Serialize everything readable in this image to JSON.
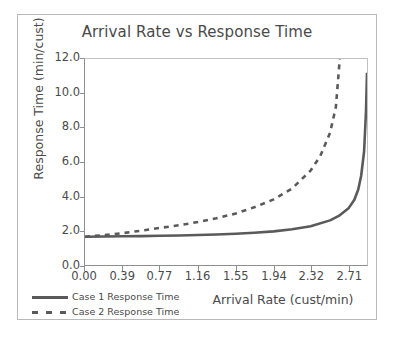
{
  "chart_data": {
    "type": "line",
    "title": "Arrival Rate vs Response Time",
    "xlabel": "Arrival Rate (cust/min)",
    "ylabel": "Response Time (min/cust)",
    "xlim": [
      0.0,
      2.9
    ],
    "ylim": [
      0.0,
      12.0
    ],
    "xticks": [
      "0.00",
      "0.39",
      "0.77",
      "1.16",
      "1.55",
      "1.94",
      "2.32",
      "2.71"
    ],
    "xtick_values": [
      0.0,
      0.39,
      0.77,
      1.16,
      1.55,
      1.94,
      2.32,
      2.71
    ],
    "yticks": [
      "0.0",
      "2.0",
      "4.0",
      "6.0",
      "8.0",
      "10.0",
      "12.0"
    ],
    "ytick_values": [
      0.0,
      2.0,
      4.0,
      6.0,
      8.0,
      10.0,
      12.0
    ],
    "grid": false,
    "legend_position": "bottom-left",
    "series": [
      {
        "name": "Case 1 Response Time",
        "style": "solid",
        "color": "#5a5a5a",
        "x": [
          0.0,
          0.2,
          0.39,
          0.58,
          0.77,
          0.97,
          1.16,
          1.35,
          1.55,
          1.74,
          1.94,
          2.13,
          2.32,
          2.52,
          2.61,
          2.71,
          2.77,
          2.81,
          2.84,
          2.87,
          2.89,
          2.9
        ],
        "y": [
          1.65,
          1.66,
          1.67,
          1.68,
          1.7,
          1.72,
          1.75,
          1.78,
          1.82,
          1.88,
          1.96,
          2.08,
          2.26,
          2.6,
          2.86,
          3.3,
          3.8,
          4.4,
          5.2,
          6.6,
          9.0,
          11.2
        ]
      },
      {
        "name": "Case 2 Response Time",
        "style": "dashed",
        "color": "#5a5a5a",
        "x": [
          0.0,
          0.2,
          0.39,
          0.58,
          0.77,
          0.97,
          1.16,
          1.35,
          1.55,
          1.74,
          1.94,
          2.13,
          2.32,
          2.42,
          2.52,
          2.58,
          2.62
        ],
        "y": [
          1.65,
          1.74,
          1.86,
          2.0,
          2.16,
          2.32,
          2.5,
          2.72,
          3.0,
          3.36,
          3.82,
          4.46,
          5.5,
          6.35,
          7.7,
          9.2,
          12.0
        ]
      }
    ]
  },
  "legend": {
    "items": [
      {
        "label": "Case 1 Response Time",
        "style": "solid"
      },
      {
        "label": "Case 2 Response Time",
        "style": "dashed"
      }
    ]
  },
  "colors": {
    "series": "#5a5a5a",
    "text": "#4a4a4a",
    "axis": "#8f8f8f",
    "frame": "#b9b9b9",
    "background": "#ffffff"
  }
}
